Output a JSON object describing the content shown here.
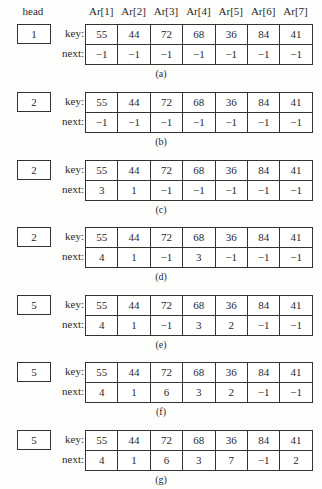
{
  "header": {
    "head_label": "head",
    "columns": [
      "Ar[1]",
      "Ar[2]",
      "Ar[3]",
      "Ar[4]",
      "Ar[5]",
      "Ar[6]",
      "Ar[7]"
    ]
  },
  "row_labels": {
    "key": "key:",
    "next": "next:"
  },
  "panels": [
    {
      "head": "1",
      "caption": "(a)",
      "key": [
        "55",
        "44",
        "72",
        "68",
        "36",
        "84",
        "41"
      ],
      "next": [
        "−1",
        "−1",
        "−1",
        "−1",
        "−1",
        "−1",
        "−1"
      ]
    },
    {
      "head": "2",
      "caption": "(b)",
      "key": [
        "55",
        "44",
        "72",
        "68",
        "36",
        "84",
        "41"
      ],
      "next": [
        "−1",
        "−1",
        "−1",
        "−1",
        "−1",
        "−1",
        "−1"
      ]
    },
    {
      "head": "2",
      "caption": "(c)",
      "key": [
        "55",
        "44",
        "72",
        "68",
        "36",
        "84",
        "41"
      ],
      "next": [
        "3",
        "1",
        "−1",
        "−1",
        "−1",
        "−1",
        "−1"
      ]
    },
    {
      "head": "2",
      "caption": "(d)",
      "key": [
        "55",
        "44",
        "72",
        "68",
        "36",
        "84",
        "41"
      ],
      "next": [
        "4",
        "1",
        "−1",
        "3",
        "−1",
        "−1",
        "−1"
      ]
    },
    {
      "head": "5",
      "caption": "(e)",
      "key": [
        "55",
        "44",
        "72",
        "68",
        "36",
        "84",
        "41"
      ],
      "next": [
        "4",
        "1",
        "−1",
        "3",
        "2",
        "−1",
        "−1"
      ]
    },
    {
      "head": "5",
      "caption": "(f)",
      "key": [
        "55",
        "44",
        "72",
        "68",
        "36",
        "84",
        "41"
      ],
      "next": [
        "4",
        "1",
        "6",
        "3",
        "2",
        "−1",
        "−1"
      ]
    },
    {
      "head": "5",
      "caption": "(g)",
      "key": [
        "55",
        "44",
        "72",
        "68",
        "36",
        "84",
        "41"
      ],
      "next": [
        "4",
        "1",
        "6",
        "3",
        "7",
        "−1",
        "2"
      ]
    }
  ]
}
